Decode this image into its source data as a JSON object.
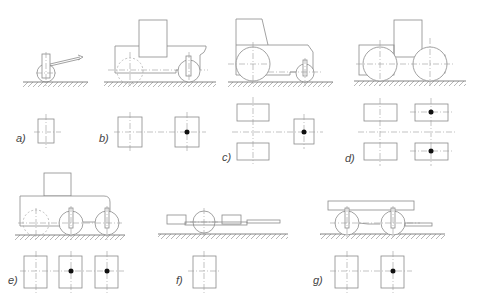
{
  "figure": {
    "panels": [
      {
        "id": "a",
        "label": "a)",
        "vehicle": "single-axle walking tractor",
        "wheels_plan": 1,
        "driven_marks": 0
      },
      {
        "id": "b",
        "label": "b)",
        "vehicle": "two-axle tractor, large rear / small front wheel",
        "wheels_plan": 2,
        "driven_marks": 1
      },
      {
        "id": "c",
        "label": "c)",
        "vehicle": "tractor with large rear wheels, small front wheel (tricycle layout)",
        "wheels_plan": 3,
        "driven_marks": 1
      },
      {
        "id": "d",
        "label": "d)",
        "vehicle": "four-wheel tractor, equal wheels",
        "wheels_plan": 4,
        "driven_marks": 2
      },
      {
        "id": "e",
        "label": "e)",
        "vehicle": "three-axle vehicle",
        "wheels_plan": 3,
        "driven_marks": 2
      },
      {
        "id": "f",
        "label": "f)",
        "vehicle": "single-axle trailer with drawbar",
        "wheels_plan": 1,
        "driven_marks": 0
      },
      {
        "id": "g",
        "label": "g)",
        "vehicle": "two-axle trailer with drawbar",
        "wheels_plan": 2,
        "driven_marks": 1
      }
    ]
  },
  "colors": {
    "line": "#8a8a8a",
    "dot": "#111111",
    "background": "#ffffff"
  }
}
